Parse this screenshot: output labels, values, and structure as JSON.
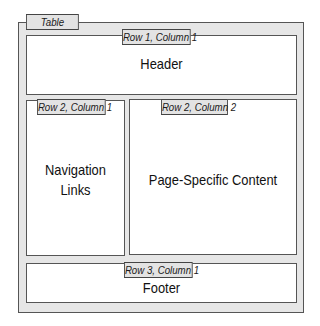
{
  "table": {
    "label": "Table"
  },
  "cells": {
    "r1c1": {
      "tag": "Row 1, Column 1",
      "content": "Header"
    },
    "r2c1": {
      "tag": "Row 2, Column 1",
      "content_line1": "Navigation",
      "content_line2": "Links"
    },
    "r2c2": {
      "tag": "Row 2, Column 2",
      "content": "Page-Specific Content"
    },
    "r3c1": {
      "tag": "Row 3, Column 1",
      "content": "Footer"
    }
  },
  "colors": {
    "table_fill": "#e6e6e6",
    "cell_fill": "#ffffff",
    "tag_fill": "#e3e3e3",
    "border": "#555555"
  }
}
